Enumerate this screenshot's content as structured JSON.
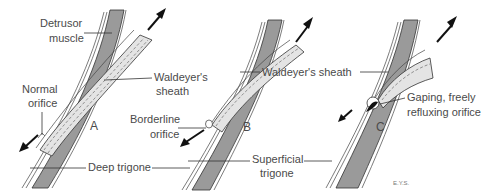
{
  "figure": {
    "panels": [
      {
        "id": "A",
        "letter": "A",
        "labels": {
          "detrusor_line1": "Detrusor",
          "detrusor_line2": "muscle",
          "orifice_line1": "Normal",
          "orifice_line2": "orifice",
          "sheath_line1": "Waldeyer's",
          "sheath_line2": "sheath",
          "trigone": "Deep trigone"
        }
      },
      {
        "id": "B",
        "letter": "B",
        "labels": {
          "orifice_line1": "Borderline",
          "orifice_line2": "orifice",
          "sheath": "Waldeyer's sheath",
          "trigone_line1": "Superficial",
          "trigone_line2": "trigone"
        }
      },
      {
        "id": "C",
        "letter": "C",
        "labels": {
          "orifice_line1": "Gaping, freely",
          "orifice_line2": "refluxing orifice"
        }
      }
    ],
    "signature": "E.Y.S.",
    "colors": {
      "muscle": "#9a9a9a",
      "sheath": "#e4e4e4",
      "text": "#4a4a4a",
      "line": "#333333"
    }
  }
}
